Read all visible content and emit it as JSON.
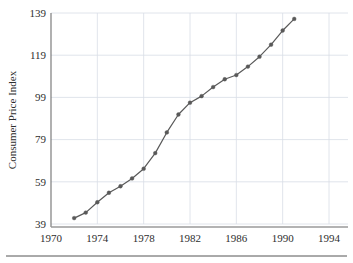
{
  "chart_data": {
    "type": "line",
    "title": "",
    "subtitle": "",
    "xlabel": "",
    "ylabel": "Consumer Price Index",
    "xlim": [
      1970,
      1994
    ],
    "ylim": [
      39,
      139
    ],
    "xticks": [
      1970,
      1974,
      1978,
      1982,
      1986,
      1990,
      1994
    ],
    "yticks": [
      39,
      59,
      79,
      99,
      119,
      139
    ],
    "xtick_labels": [
      "1970",
      "1974",
      "1978",
      "1982",
      "1986",
      "1990",
      "1994"
    ],
    "ytick_labels": [
      "39",
      "59",
      "79",
      "99",
      "119",
      "139"
    ],
    "grid": true,
    "grid_color": "#d8dde6",
    "legend": null,
    "legend_position": "none",
    "marker": "filled-circle",
    "marker_color": "#595959",
    "line_color": "#595959",
    "line_width": 1.2,
    "x": [
      1972,
      1973,
      1974,
      1975,
      1976,
      1977,
      1978,
      1979,
      1980,
      1981,
      1982,
      1983,
      1984,
      1985,
      1986,
      1987,
      1988,
      1989,
      1990,
      1991
    ],
    "values": [
      41.8,
      44.4,
      49.3,
      53.8,
      56.9,
      60.6,
      65.2,
      72.6,
      82.4,
      90.9,
      96.5,
      99.6,
      103.9,
      107.6,
      109.6,
      113.6,
      118.3,
      124.0,
      130.7,
      136.2
    ],
    "series": [
      {
        "name": "Consumer Price Index",
        "values": [
          41.8,
          44.4,
          49.3,
          53.8,
          56.9,
          60.6,
          65.2,
          72.6,
          82.4,
          90.9,
          96.5,
          99.6,
          103.9,
          107.6,
          109.6,
          113.6,
          118.3,
          124.0,
          130.7,
          136.2
        ]
      }
    ]
  },
  "figure": {
    "background": "#ffffff",
    "axis_color": "#7a7a7a",
    "text_color": "#2e2e2e"
  },
  "footer": {
    "rule_visible": true
  }
}
